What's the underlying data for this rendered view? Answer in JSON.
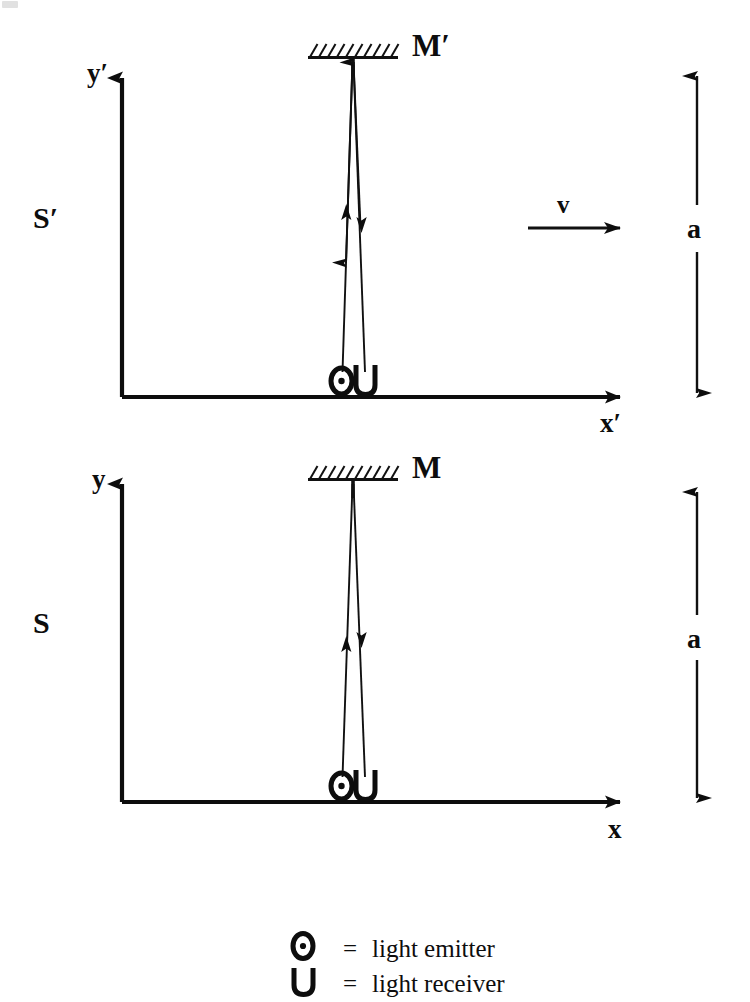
{
  "figure": {
    "background_color": "#ffffff",
    "ink_color": "#0d0d0d"
  },
  "frames": [
    {
      "id": "moving",
      "frame_label": "S′",
      "y_axis_label": "y′",
      "x_axis_label": "x′",
      "mirror_label": "M′",
      "dimension_label": "a",
      "emitter_symbol": "⊙",
      "receiver_symbol": "U"
    },
    {
      "id": "rest",
      "frame_label": "S",
      "y_axis_label": "y",
      "x_axis_label": "x",
      "mirror_label": "M",
      "dimension_label": "a",
      "emitter_symbol": "⊙",
      "receiver_symbol": "U"
    }
  ],
  "velocity": {
    "label": "v"
  },
  "legend": {
    "rows": [
      {
        "symbol": "⊙",
        "equals": "=",
        "description": "light emitter"
      },
      {
        "symbol": "U",
        "equals": "=",
        "description": "light receiver"
      }
    ]
  }
}
